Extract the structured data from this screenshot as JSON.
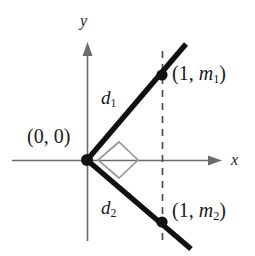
{
  "figure": {
    "background_color": "#ffffff",
    "axis_color": "#6b6b6b",
    "ray_color": "#111111",
    "dashed_color": "#4d4d4d",
    "right_angle_color": "#9a9a9a",
    "point_color": "#111111",
    "axes": {
      "x_label": "x",
      "y_label": "y",
      "x_axis": {
        "x1": 12,
        "y1": 160,
        "x2": 222,
        "y2": 160
      },
      "y_axis": {
        "x1": 87,
        "y1": 42,
        "x2": 87,
        "y2": 241
      },
      "x_label_pos": {
        "x": 231,
        "y": 152
      },
      "y_label_pos": {
        "x": 80,
        "y": 13
      }
    },
    "rays": [
      {
        "name": "ray-upper",
        "x1": 87,
        "y1": 160,
        "x2": 186,
        "y2": 44
      },
      {
        "name": "ray-lower",
        "x1": 87,
        "y1": 160,
        "x2": 191,
        "y2": 249
      }
    ],
    "dashed_line": {
      "x": 162,
      "y1": 51,
      "y2": 246
    },
    "right_angle_marker": {
      "points": "98,160 119,142 138,160 119,178",
      "description": "square right-angle symbol at origin between the two rays"
    },
    "points": [
      {
        "name": "point-upper",
        "cx": 162,
        "cy": 75,
        "r": 5.6,
        "label": "(1, m",
        "label_sub": "1",
        "label_close": ")",
        "label_x": 172,
        "label_y": 63
      },
      {
        "name": "point-lower",
        "cx": 162,
        "cy": 222,
        "r": 5.6,
        "label": "(1, m",
        "label_sub": "2",
        "label_close": ")",
        "label_x": 172,
        "label_y": 200
      }
    ],
    "origin": {
      "cx": 87,
      "cy": 160,
      "r": 6.0,
      "label": "(0, 0)",
      "label_x": 27,
      "label_y": 126
    },
    "distance_labels": [
      {
        "name": "distance-d1",
        "text": "d",
        "sub": "1",
        "x": 101,
        "y": 88
      },
      {
        "name": "distance-d2",
        "text": "d",
        "sub": "2",
        "x": 101,
        "y": 198
      }
    ]
  }
}
